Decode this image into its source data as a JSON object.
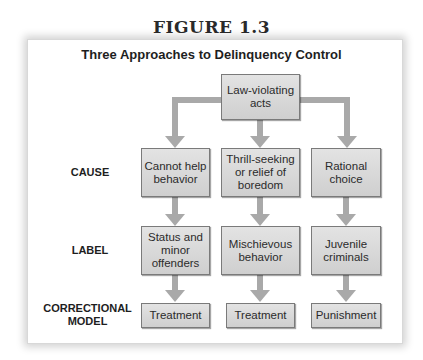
{
  "figure": {
    "number_label": "FIGURE 1.3",
    "title": "Three Approaches to Delinquency Control"
  },
  "root": {
    "label": "Law-violating acts"
  },
  "row_labels": {
    "cause": "CAUSE",
    "label": "LABEL",
    "model_line1": "CORRECTIONAL",
    "model_line2": "MODEL"
  },
  "columns": [
    {
      "cause": "Cannot help behavior",
      "label": "Status and minor offenders",
      "model": "Treatment"
    },
    {
      "cause": "Thrill-seeking or relief of boredom",
      "label": "Mischievous behavior",
      "model": "Treatment"
    },
    {
      "cause": "Rational choice",
      "label": "Juvenile criminals",
      "model": "Punishment"
    }
  ],
  "colors": {
    "box_fill": "#d9d9d9",
    "arrow": "#a9a9a9",
    "border": "#7a7a7a"
  }
}
